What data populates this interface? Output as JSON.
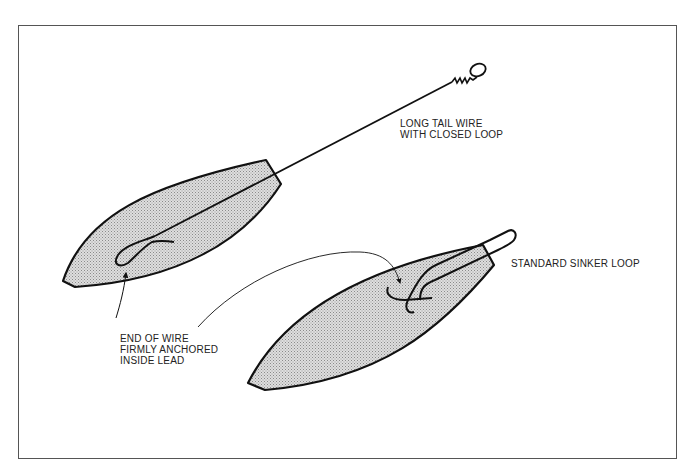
{
  "diagram": {
    "type": "illustration",
    "colors": {
      "frame": "#555555",
      "outline": "#111111",
      "fill": "#d4d4d4",
      "text": "#222222"
    },
    "labels": {
      "long_tail": {
        "line1": "LONG TAIL WIRE",
        "line2": "WITH CLOSED LOOP"
      },
      "standard_loop": {
        "line1": "STANDARD SINKER LOOP"
      },
      "anchored": {
        "line1": "END OF WIRE",
        "line2": "FIRMLY ANCHORED",
        "line3": "INSIDE LEAD"
      }
    },
    "elements": [
      {
        "id": "sinker-long-tail",
        "description": "Lead sinker with long tail wire ending in closed loop"
      },
      {
        "id": "sinker-standard",
        "description": "Lead sinker with standard short wire loop"
      },
      {
        "id": "pointer-arrows",
        "description": "Leader lines from 'end of wire' label to anchored wire ends in both sinkers"
      }
    ]
  }
}
